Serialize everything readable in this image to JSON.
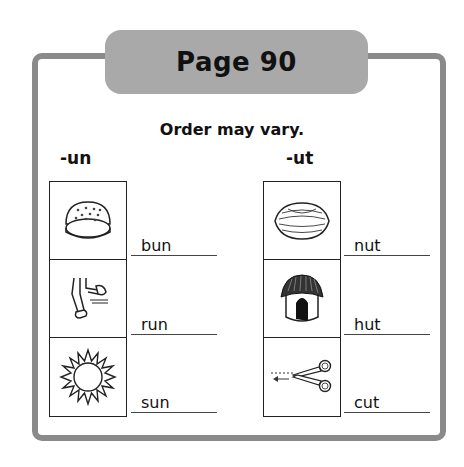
{
  "header": {
    "title": "Page 90"
  },
  "subtitle": "Order may vary.",
  "columns": [
    {
      "heading": "-un",
      "items": [
        {
          "picture": "bun-icon",
          "word": "bun"
        },
        {
          "picture": "running-legs-icon",
          "word": "run"
        },
        {
          "picture": "sun-icon",
          "word": "sun"
        }
      ]
    },
    {
      "heading": "-ut",
      "items": [
        {
          "picture": "nut-icon",
          "word": "nut"
        },
        {
          "picture": "hut-icon",
          "word": "hut"
        },
        {
          "picture": "scissors-cut-icon",
          "word": "cut"
        }
      ]
    }
  ],
  "colors": {
    "frame": "#8a8a8a",
    "tab": "#a9a9a9",
    "ink": "#111111"
  }
}
